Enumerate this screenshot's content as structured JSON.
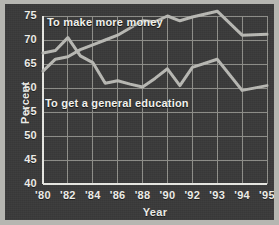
{
  "chart_data": {
    "type": "line",
    "title": "",
    "xlabel": "Year",
    "ylabel": "Percent",
    "ylim": [
      40,
      75
    ],
    "yticks": [
      40,
      45,
      50,
      55,
      60,
      65,
      70,
      75
    ],
    "xticks": [
      "'80",
      "'82",
      "'84",
      "'86",
      "'88",
      "'90",
      "'92",
      "'93",
      "'94",
      "'95"
    ],
    "x": [
      1980,
      1981,
      1982,
      1983,
      1984,
      1985,
      1986,
      1987,
      1988,
      1989,
      1990,
      1991,
      1992,
      1993,
      1994,
      1995
    ],
    "grid": true,
    "legend": "inline-annotations",
    "series": [
      {
        "name": "To make more money",
        "color": "#b9b9b4",
        "values": [
          63.5,
          66.0,
          66.5,
          68.0,
          69.0,
          70.0,
          71.0,
          72.5,
          74.0,
          73.8,
          75.0,
          74.0,
          74.8,
          76.0,
          71.0,
          71.2
        ]
      },
      {
        "name": "To get a general education",
        "color": "#b9b9b4",
        "values": [
          67.3,
          67.8,
          70.5,
          66.7,
          65.3,
          61.0,
          61.5,
          60.8,
          60.2,
          62.0,
          64.0,
          60.5,
          64.3,
          66.0,
          59.5,
          60.5
        ]
      }
    ],
    "annotations": [
      {
        "text": "To make more money",
        "x_px": 42,
        "y_px": 12
      },
      {
        "text": "To get a general education",
        "x_px": 40,
        "y_px": 93
      }
    ]
  },
  "style": {
    "panel_bg": "#3a3a3a",
    "mat_bg": "#b6b6b1",
    "grid_color": "#8f8f8a",
    "axis_color": "#e8e8e3",
    "text_color": "#efefea",
    "line_color": "#b9b9b4"
  }
}
